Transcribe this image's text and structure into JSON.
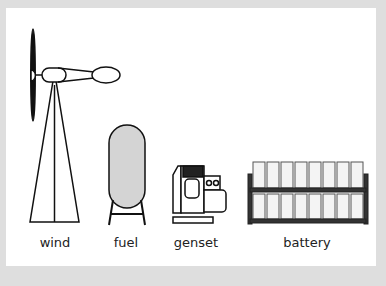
{
  "labels": {
    "wind": "wind",
    "fuel": "fuel",
    "genset": "genset",
    "battery": "battery"
  },
  "colors": {
    "background": "#dedede",
    "panel": "#ffffff",
    "stroke": "#111111",
    "tank_fill": "#d4d4d4",
    "cell_fill": "#f4f4f4"
  }
}
